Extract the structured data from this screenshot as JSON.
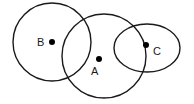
{
  "diagram": {
    "type": "venn-like overlapping shapes",
    "background": "#ffffff",
    "stroke_color": "#1a1a1a",
    "shapes": [
      {
        "id": "B",
        "kind": "circle",
        "cx": 52,
        "cy": 42,
        "r": 39
      },
      {
        "id": "A",
        "kind": "circle",
        "cx": 104,
        "cy": 56,
        "r": 42
      },
      {
        "id": "C",
        "kind": "ellipse",
        "cx": 147,
        "cy": 48,
        "rx": 33,
        "ry": 24
      }
    ],
    "points": [
      {
        "id": "B",
        "label": "B",
        "x": 52,
        "y": 42,
        "label_x": 37,
        "label_y": 46
      },
      {
        "id": "A",
        "label": "A",
        "x": 99,
        "y": 59,
        "label_x": 91,
        "label_y": 75
      },
      {
        "id": "C",
        "label": "C",
        "x": 146,
        "y": 45,
        "label_x": 153,
        "label_y": 55
      }
    ]
  }
}
